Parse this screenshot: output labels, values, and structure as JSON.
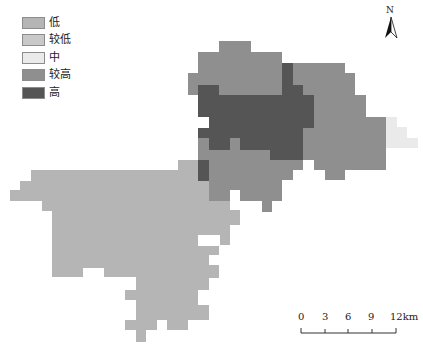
{
  "legend": {
    "items": [
      {
        "label": "低",
        "color": "#b5b5b5"
      },
      {
        "label": "较低",
        "color": "#c9c9c9"
      },
      {
        "label": "中",
        "color": "#eaeaea"
      },
      {
        "label": "较高",
        "color": "#8f8f8f"
      },
      {
        "label": "高",
        "color": "#555555"
      }
    ]
  },
  "north_arrow": {
    "label": "N"
  },
  "scale_bar": {
    "ticks": [
      "0",
      "3",
      "6",
      "9",
      "12km"
    ]
  },
  "map": {
    "regions": [
      {
        "class": "低",
        "color": "#b5b5b5",
        "name": "southwest-region"
      },
      {
        "class": "较高",
        "color": "#8f8f8f",
        "name": "north-region"
      },
      {
        "class": "较高",
        "color": "#8f8f8f",
        "name": "east-region"
      },
      {
        "class": "较高",
        "color": "#8f8f8f",
        "name": "south-central-region"
      },
      {
        "class": "高",
        "color": "#555555",
        "name": "central-region"
      },
      {
        "class": "中",
        "color": "#eaeaea",
        "name": "far-east-region"
      }
    ]
  }
}
